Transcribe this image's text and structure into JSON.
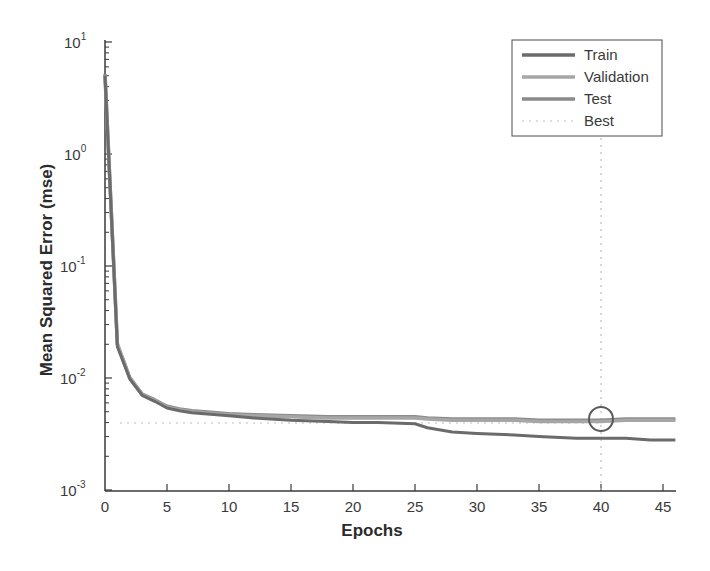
{
  "chart_data": {
    "type": "line",
    "title": "",
    "xlabel": "Epochs",
    "ylabel": "Mean Squared Error  (mse)",
    "yscale": "log",
    "xlim": [
      0,
      46
    ],
    "ylim": [
      0.001,
      10
    ],
    "grid": false,
    "legend_position": "upper right",
    "x_ticks": [
      0,
      5,
      10,
      15,
      20,
      25,
      30,
      35,
      40,
      45
    ],
    "y_ticks": [
      "10^-3",
      "10^-2",
      "10^-1",
      "10^0",
      "10^1"
    ],
    "x": [
      0,
      1,
      2,
      3,
      4,
      5,
      6,
      7,
      8,
      9,
      10,
      12,
      15,
      18,
      20,
      22,
      25,
      26,
      28,
      30,
      33,
      35,
      38,
      40,
      42,
      44,
      46
    ],
    "series": [
      {
        "name": "Train",
        "values": [
          5.0,
          0.019,
          0.0098,
          0.007,
          0.0062,
          0.0054,
          0.0051,
          0.0049,
          0.0048,
          0.0047,
          0.0046,
          0.0044,
          0.0042,
          0.0041,
          0.004,
          0.004,
          0.0039,
          0.0036,
          0.0033,
          0.0032,
          0.0031,
          0.003,
          0.0029,
          0.0029,
          0.0029,
          0.0028,
          0.0028
        ]
      },
      {
        "name": "Validation",
        "values": [
          5.0,
          0.02,
          0.01,
          0.0071,
          0.0063,
          0.0055,
          0.0052,
          0.005,
          0.0049,
          0.0048,
          0.0047,
          0.0046,
          0.0045,
          0.0044,
          0.0044,
          0.0044,
          0.0044,
          0.0043,
          0.0042,
          0.0042,
          0.0042,
          0.0041,
          0.0041,
          0.0041,
          0.0042,
          0.0042,
          0.0042
        ]
      },
      {
        "name": "Test",
        "values": [
          5.2,
          0.02,
          0.0101,
          0.0072,
          0.0064,
          0.0056,
          0.0053,
          0.0051,
          0.005,
          0.0049,
          0.0048,
          0.0047,
          0.0046,
          0.0045,
          0.0045,
          0.0045,
          0.0045,
          0.0044,
          0.0043,
          0.0043,
          0.0043,
          0.0042,
          0.0042,
          0.0042,
          0.0043,
          0.0043,
          0.0043
        ]
      }
    ],
    "annotations": {
      "best_epoch": 40,
      "best_value": 0.0041,
      "best_marker": "circle",
      "best_line": "dotted horizontal at best validation mse and dotted vertical at best epoch"
    }
  },
  "axes": {
    "xlabel": "Epochs",
    "ylabel": "Mean Squared Error  (mse)",
    "x_tick_labels": [
      "0",
      "5",
      "10",
      "15",
      "20",
      "25",
      "30",
      "35",
      "40",
      "45"
    ],
    "y_tick_bases": [
      "10",
      "10",
      "10",
      "10",
      "10"
    ],
    "y_tick_exps": [
      "1",
      "0",
      "-1",
      "-2",
      "-3"
    ]
  },
  "legend": {
    "items": [
      {
        "label": "Train",
        "style": "solid"
      },
      {
        "label": "Validation",
        "style": "solid"
      },
      {
        "label": "Test",
        "style": "solid"
      },
      {
        "label": "Best",
        "style": "dotted"
      }
    ]
  },
  "colors": {
    "train": "#6b6b6b",
    "validation": "#a6a6a6",
    "test": "#8a8a8a",
    "best": "#bdbdbd",
    "axis": "#3a3a3a"
  }
}
